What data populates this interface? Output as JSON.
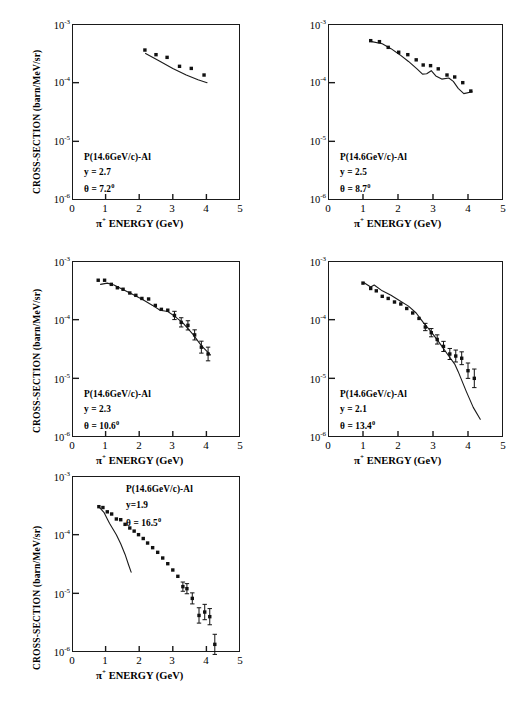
{
  "figure": {
    "axis_y_title": "CROSS-SECTION (barn/MeV/sr)",
    "axis_x_title_pi": "π",
    "axis_x_title_plus": "+",
    "axis_x_title_rest": "ENERGY   (GeV)",
    "y_ticks": [
      "-3",
      "-4",
      "-5",
      "-6"
    ],
    "y_tick_base": "10",
    "x_ticks": [
      "0",
      "1",
      "2",
      "3",
      "4",
      "5"
    ],
    "reaction_label": "P(14.6GeV/c)-Al",
    "line_color": "#1a1a1a",
    "marker_color": "#111111"
  },
  "chart_data": [
    {
      "type": "scatter",
      "panel": 1,
      "title": "P(14.6GeV/c)-Al",
      "rapidity_label": "y = 2.7",
      "angle_label": "θ = 7.2",
      "angle_sup": "0",
      "xlabel": "π+ ENERGY (GeV)",
      "ylabel": "CROSS-SECTION (barn/MeV/sr)",
      "xlim": [
        0,
        5
      ],
      "ylim": [
        1e-06,
        0.001
      ],
      "yscale": "log",
      "grid": false,
      "points": [
        {
          "x": 2.17,
          "y": 0.00036,
          "err": 0
        },
        {
          "x": 2.5,
          "y": 0.0003,
          "err": 0
        },
        {
          "x": 2.83,
          "y": 0.00027,
          "err": 0
        },
        {
          "x": 3.2,
          "y": 0.00019,
          "err": 0
        },
        {
          "x": 3.55,
          "y": 0.000175,
          "err": 0
        },
        {
          "x": 3.93,
          "y": 0.000135,
          "err": 0
        }
      ],
      "curve": [
        {
          "x": 2.19,
          "y": 0.000315
        },
        {
          "x": 2.6,
          "y": 0.000235
        },
        {
          "x": 3.0,
          "y": 0.000175
        },
        {
          "x": 3.4,
          "y": 0.000135
        },
        {
          "x": 3.75,
          "y": 0.000112
        },
        {
          "x": 4.02,
          "y": 0.0001
        }
      ]
    },
    {
      "type": "scatter",
      "panel": 2,
      "title": "P(14.6GeV/c)-Al",
      "rapidity_label": "y  =  2.5",
      "angle_label": "θ = 8.7",
      "angle_sup": "0",
      "xlabel": "π+ ENERGY (GeV)",
      "ylabel": "CROSS-SECTION (barn/MeV/sr)",
      "xlim": [
        0,
        5
      ],
      "ylim": [
        1e-06,
        0.001
      ],
      "yscale": "log",
      "grid": false,
      "points": [
        {
          "x": 1.22,
          "y": 0.00052,
          "err": 0
        },
        {
          "x": 1.47,
          "y": 0.0005,
          "err": 0
        },
        {
          "x": 1.72,
          "y": 0.0004,
          "err": 0
        },
        {
          "x": 2.02,
          "y": 0.00033,
          "err": 0
        },
        {
          "x": 2.28,
          "y": 0.0003,
          "err": 0
        },
        {
          "x": 2.52,
          "y": 0.000245,
          "err": 0
        },
        {
          "x": 2.72,
          "y": 0.0002,
          "err": 0
        },
        {
          "x": 2.93,
          "y": 0.000195,
          "err": 0
        },
        {
          "x": 3.15,
          "y": 0.000172,
          "err": 0
        },
        {
          "x": 3.4,
          "y": 0.000135,
          "err": 0
        },
        {
          "x": 3.62,
          "y": 0.000125,
          "err": 0
        },
        {
          "x": 3.85,
          "y": 0.0001,
          "err": 0
        },
        {
          "x": 4.08,
          "y": 7.2e-05,
          "err": 0
        }
      ],
      "curve": [
        {
          "x": 1.25,
          "y": 0.0005
        },
        {
          "x": 1.55,
          "y": 0.00046
        },
        {
          "x": 1.8,
          "y": 0.00038
        },
        {
          "x": 2.05,
          "y": 0.0003
        },
        {
          "x": 2.3,
          "y": 0.00023
        },
        {
          "x": 2.55,
          "y": 0.00017
        },
        {
          "x": 2.7,
          "y": 0.00014
        },
        {
          "x": 2.82,
          "y": 0.000142
        },
        {
          "x": 2.95,
          "y": 0.00016
        },
        {
          "x": 3.08,
          "y": 0.00013
        },
        {
          "x": 3.25,
          "y": 0.000115
        },
        {
          "x": 3.45,
          "y": 0.00012
        },
        {
          "x": 3.58,
          "y": 0.000105
        },
        {
          "x": 3.72,
          "y": 8e-05
        },
        {
          "x": 3.88,
          "y": 6.5e-05
        },
        {
          "x": 4.12,
          "y": 7e-05
        }
      ]
    },
    {
      "type": "scatter",
      "panel": 3,
      "title": "P(14.6GeV/c)-Al",
      "rapidity_label": "y = 2.3",
      "angle_label": "θ = 10.6",
      "angle_sup": "0",
      "xlabel": "π+ ENERGY (GeV)",
      "ylabel": "CROSS-SECTION (barn/MeV/sr)",
      "xlim": [
        0,
        5
      ],
      "ylim": [
        1e-06,
        0.001
      ],
      "yscale": "log",
      "grid": false,
      "points": [
        {
          "x": 0.78,
          "y": 0.00047,
          "err": 0
        },
        {
          "x": 0.97,
          "y": 0.00047,
          "err": 0
        },
        {
          "x": 1.17,
          "y": 0.0004,
          "err": 0
        },
        {
          "x": 1.35,
          "y": 0.00035,
          "err": 0
        },
        {
          "x": 1.52,
          "y": 0.00033,
          "err": 0
        },
        {
          "x": 1.72,
          "y": 0.000285,
          "err": 0
        },
        {
          "x": 1.9,
          "y": 0.00026,
          "err": 0
        },
        {
          "x": 2.08,
          "y": 0.00023,
          "err": 0
        },
        {
          "x": 2.28,
          "y": 0.000225,
          "err": 0
        },
        {
          "x": 2.48,
          "y": 0.000175,
          "err": 0
        },
        {
          "x": 2.66,
          "y": 0.00015,
          "err": 0
        },
        {
          "x": 2.85,
          "y": 0.000145,
          "err": 0
        },
        {
          "x": 3.05,
          "y": 0.000118,
          "err": 0.08
        },
        {
          "x": 3.25,
          "y": 9e-05,
          "err": 0.09
        },
        {
          "x": 3.45,
          "y": 8e-05,
          "err": 0.09
        },
        {
          "x": 3.65,
          "y": 5.5e-05,
          "err": 0.1
        },
        {
          "x": 3.85,
          "y": 3.4e-05,
          "err": 0.12
        },
        {
          "x": 4.05,
          "y": 2.6e-05,
          "err": 0.14
        }
      ],
      "curve": [
        {
          "x": 0.85,
          "y": 0.0004
        },
        {
          "x": 1.05,
          "y": 0.00042
        },
        {
          "x": 1.25,
          "y": 0.00039
        },
        {
          "x": 1.5,
          "y": 0.00033
        },
        {
          "x": 1.8,
          "y": 0.00027
        },
        {
          "x": 2.1,
          "y": 0.00022
        },
        {
          "x": 2.4,
          "y": 0.000175
        },
        {
          "x": 2.62,
          "y": 0.000145
        },
        {
          "x": 2.85,
          "y": 0.000138
        },
        {
          "x": 3.05,
          "y": 0.000115
        },
        {
          "x": 3.3,
          "y": 8.8e-05
        },
        {
          "x": 3.6,
          "y": 5.6e-05
        },
        {
          "x": 3.85,
          "y": 3.6e-05
        },
        {
          "x": 4.12,
          "y": 2.5e-05
        }
      ]
    },
    {
      "type": "scatter",
      "panel": 4,
      "title": "P(14.6GeV/c)-Al",
      "rapidity_label": "y  =  2.1",
      "angle_label": "θ = 13.4",
      "angle_sup": "0",
      "xlabel": "π+ ENERGY (GeV)",
      "ylabel": "CROSS-SECTION (barn/MeV/sr)",
      "xlim": [
        0,
        5
      ],
      "ylim": [
        1e-06,
        0.001
      ],
      "yscale": "log",
      "grid": false,
      "points": [
        {
          "x": 1.0,
          "y": 0.00042,
          "err": 0
        },
        {
          "x": 1.22,
          "y": 0.00034,
          "err": 0
        },
        {
          "x": 1.38,
          "y": 0.00031,
          "err": 0
        },
        {
          "x": 1.55,
          "y": 0.00025,
          "err": 0
        },
        {
          "x": 1.72,
          "y": 0.00023,
          "err": 0
        },
        {
          "x": 1.9,
          "y": 0.0002,
          "err": 0
        },
        {
          "x": 2.08,
          "y": 0.000185,
          "err": 0
        },
        {
          "x": 2.25,
          "y": 0.000155,
          "err": 0
        },
        {
          "x": 2.42,
          "y": 0.00013,
          "err": 0
        },
        {
          "x": 2.6,
          "y": 0.000105,
          "err": 0
        },
        {
          "x": 2.78,
          "y": 7.5e-05,
          "err": 0.07
        },
        {
          "x": 2.95,
          "y": 6e-05,
          "err": 0.08
        },
        {
          "x": 3.12,
          "y": 4.6e-05,
          "err": 0.09
        },
        {
          "x": 3.3,
          "y": 3.5e-05,
          "err": 0.1
        },
        {
          "x": 3.48,
          "y": 2.6e-05,
          "err": 0.11
        },
        {
          "x": 3.65,
          "y": 2.4e-05,
          "err": 0.12
        },
        {
          "x": 3.82,
          "y": 2.2e-05,
          "err": 0.13
        },
        {
          "x": 4.0,
          "y": 1.35e-05,
          "err": 0.16
        },
        {
          "x": 4.18,
          "y": 1e-05,
          "err": 0.2
        }
      ],
      "curve": [
        {
          "x": 1.02,
          "y": 0.00043
        },
        {
          "x": 1.22,
          "y": 0.00036
        },
        {
          "x": 1.32,
          "y": 0.00039
        },
        {
          "x": 1.55,
          "y": 0.00031
        },
        {
          "x": 1.8,
          "y": 0.00026
        },
        {
          "x": 2.05,
          "y": 0.00021
        },
        {
          "x": 2.3,
          "y": 0.00017
        },
        {
          "x": 2.52,
          "y": 0.00013
        },
        {
          "x": 2.72,
          "y": 9e-05
        },
        {
          "x": 2.95,
          "y": 6.2e-05
        },
        {
          "x": 3.2,
          "y": 3.9e-05
        },
        {
          "x": 3.45,
          "y": 2.4e-05
        },
        {
          "x": 3.62,
          "y": 1.75e-05
        },
        {
          "x": 3.72,
          "y": 1.3e-05
        },
        {
          "x": 3.95,
          "y": 6e-06
        },
        {
          "x": 4.15,
          "y": 3.2e-06
        },
        {
          "x": 4.35,
          "y": 2e-06
        }
      ]
    },
    {
      "type": "scatter",
      "panel": 5,
      "title": "P(14.6GeV/c)-Al",
      "rapidity_label": "y=1.9",
      "angle_label": "θ = 16.5",
      "angle_sup": "0",
      "xlabel": "π+ ENERGY (GeV)",
      "ylabel": "CROSS-SECTION (barn/MeV/sr)",
      "xlim": [
        0,
        5
      ],
      "ylim": [
        1e-06,
        0.001
      ],
      "yscale": "log",
      "grid": false,
      "points": [
        {
          "x": 0.8,
          "y": 0.0003,
          "err": 0
        },
        {
          "x": 0.92,
          "y": 0.00029,
          "err": 0
        },
        {
          "x": 1.05,
          "y": 0.000245,
          "err": 0
        },
        {
          "x": 1.18,
          "y": 0.000225,
          "err": 0
        },
        {
          "x": 1.32,
          "y": 0.000185,
          "err": 0
        },
        {
          "x": 1.45,
          "y": 0.00018,
          "err": 0
        },
        {
          "x": 1.58,
          "y": 0.00015,
          "err": 0
        },
        {
          "x": 1.72,
          "y": 0.00013,
          "err": 0
        },
        {
          "x": 1.85,
          "y": 0.000115,
          "err": 0
        },
        {
          "x": 1.98,
          "y": 0.0001,
          "err": 0
        },
        {
          "x": 2.12,
          "y": 8.6e-05,
          "err": 0
        },
        {
          "x": 2.25,
          "y": 7.2e-05,
          "err": 0
        },
        {
          "x": 2.4,
          "y": 6e-05,
          "err": 0
        },
        {
          "x": 2.55,
          "y": 5e-05,
          "err": 0
        },
        {
          "x": 2.7,
          "y": 4e-05,
          "err": 0
        },
        {
          "x": 2.85,
          "y": 3.2e-05,
          "err": 0
        },
        {
          "x": 3.0,
          "y": 2.5e-05,
          "err": 0
        },
        {
          "x": 3.15,
          "y": 1.95e-05,
          "err": 0
        },
        {
          "x": 3.3,
          "y": 1.3e-05,
          "err": 0.09
        },
        {
          "x": 3.42,
          "y": 1.2e-05,
          "err": 0.1
        },
        {
          "x": 3.58,
          "y": 8.2e-06,
          "err": 0.11
        },
        {
          "x": 3.78,
          "y": 4.2e-06,
          "err": 0.16
        },
        {
          "x": 3.95,
          "y": 4.8e-06,
          "err": 0.16
        },
        {
          "x": 4.1,
          "y": 4e-06,
          "err": 0.17
        },
        {
          "x": 4.25,
          "y": 1.35e-06,
          "err": 0.22
        }
      ],
      "curve": [
        {
          "x": 0.82,
          "y": 0.00029
        },
        {
          "x": 0.95,
          "y": 0.00024
        },
        {
          "x": 1.05,
          "y": 0.000185
        },
        {
          "x": 1.12,
          "y": 0.000155
        },
        {
          "x": 1.2,
          "y": 0.00013
        },
        {
          "x": 1.32,
          "y": 0.0001
        },
        {
          "x": 1.45,
          "y": 7e-05
        },
        {
          "x": 1.58,
          "y": 4.6e-05
        },
        {
          "x": 1.68,
          "y": 3.1e-05
        },
        {
          "x": 1.76,
          "y": 2.3e-05
        }
      ]
    }
  ]
}
